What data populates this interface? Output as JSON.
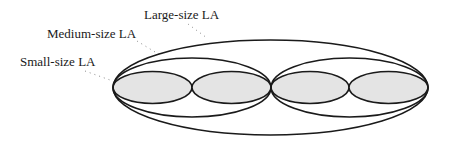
{
  "diagram": {
    "type": "nested-ellipses",
    "colors": {
      "stroke": "#1a1a1a",
      "small_fill": "#e4e4e4",
      "leader": "#8a8a8a",
      "background": "#ffffff"
    },
    "labels": [
      {
        "id": "large",
        "text": "Large-size LA",
        "x": 144,
        "y": 19,
        "leader": {
          "x1": 188,
          "y1": 24,
          "x2": 207,
          "y2": 38
        }
      },
      {
        "id": "medium",
        "text": "Medium-size LA",
        "x": 47,
        "y": 38,
        "leader": {
          "x1": 137,
          "y1": 41,
          "x2": 160,
          "y2": 55
        }
      },
      {
        "id": "small",
        "text": "Small-size LA",
        "x": 20,
        "y": 66,
        "leader": {
          "x1": 85,
          "y1": 71,
          "x2": 110,
          "y2": 80
        }
      }
    ],
    "ellipses": {
      "large": [
        {
          "cx": 270.5,
          "cy": 87.5,
          "rx": 157.5,
          "ry": 47.5
        }
      ],
      "medium": [
        {
          "cx": 192,
          "cy": 87.5,
          "rx": 79,
          "ry": 29.5
        },
        {
          "cx": 349.5,
          "cy": 87.5,
          "rx": 78.5,
          "ry": 29.5
        }
      ],
      "small": [
        {
          "cx": 152.5,
          "cy": 87.5,
          "rx": 39.5,
          "ry": 16
        },
        {
          "cx": 231.5,
          "cy": 87.5,
          "rx": 39.5,
          "ry": 16
        },
        {
          "cx": 310,
          "cy": 87.5,
          "rx": 39,
          "ry": 16
        },
        {
          "cx": 388.5,
          "cy": 87.5,
          "rx": 39.5,
          "ry": 16
        }
      ]
    }
  }
}
